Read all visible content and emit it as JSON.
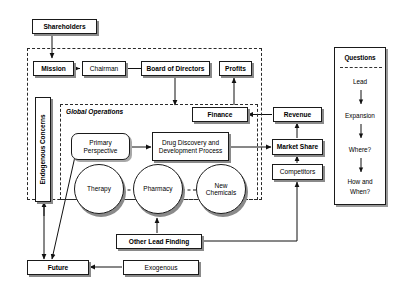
{
  "diagram": {
    "regions": {
      "enterprise_boundary": "",
      "global_operations_label": "Global Operations",
      "questions_panel_title": "Questions"
    },
    "nodes": {
      "shareholders": "Shareholders",
      "mission": "Mission",
      "chairman": "Chairman",
      "board_of_directors": "Board of Directors",
      "profits": "Profits",
      "finance": "Finance",
      "endogenous_concerns": "Endogenous Concerns",
      "primary_perspective": "Primary\nPerspective",
      "primary_perspective_line1": "Primary",
      "primary_perspective_line2": "Perspective",
      "drug_discovery_line1": "Drug Discovery and",
      "drug_discovery_line2": "Development Process",
      "therapy": "Therapy",
      "pharmacy": "Pharmacy",
      "new_chemicals_line1": "New",
      "new_chemicals_line2": "Chemicals",
      "revenue": "Revenue",
      "market_share": "Market Share",
      "competitors": "Competitors",
      "other_lead_finding": "Other Lead Finding",
      "future": "Future",
      "exogenous": "Exogenous"
    },
    "questions": [
      {
        "label": "Lead"
      },
      {
        "label": "Expansion"
      },
      {
        "label": "Where?"
      },
      {
        "label": "How and"
      },
      {
        "label": "When?"
      }
    ],
    "colors": {
      "stroke": "#1a1a1a",
      "shadow": "#8a8a8a",
      "background": "#ffffff",
      "dashed_region": "#2a2a2a"
    }
  }
}
